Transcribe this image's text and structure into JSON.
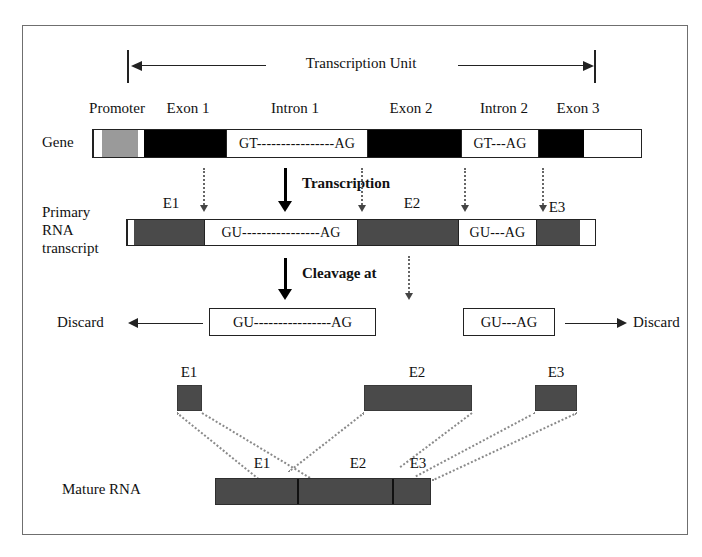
{
  "figure": {
    "span_label": "Transcription Unit",
    "process_labels": {
      "transcription": "Transcription",
      "cleavage": "Cleavage at"
    },
    "row_labels": {
      "gene": "Gene",
      "primary_rna": "Primary\nRNA\ntranscript",
      "primary_rna_line1": "Primary",
      "primary_rna_line2": "RNA",
      "primary_rna_line3": "transcript",
      "mature_rna": "Mature RNA"
    },
    "gene_row": {
      "top_labels": [
        {
          "text": "Promoter"
        },
        {
          "text": "Exon 1"
        },
        {
          "text": "Intron 1"
        },
        {
          "text": "Exon 2"
        },
        {
          "text": "Intron 2"
        },
        {
          "text": "Exon 3"
        }
      ],
      "segments": [
        {
          "kind": "promoter",
          "fill": "gray",
          "text": ""
        },
        {
          "kind": "exon",
          "fill": "black",
          "text": ""
        },
        {
          "kind": "intron",
          "fill": "white",
          "text": "GT----------------AG"
        },
        {
          "kind": "exon",
          "fill": "black",
          "text": ""
        },
        {
          "kind": "intron",
          "fill": "white",
          "text": "GT---AG"
        },
        {
          "kind": "exon",
          "fill": "black",
          "text": ""
        }
      ]
    },
    "rna_row": {
      "exon_labels": [
        "E1",
        "E2",
        "E3"
      ],
      "segments": [
        {
          "kind": "exon",
          "fill": "dkgray",
          "text": ""
        },
        {
          "kind": "intron",
          "fill": "white",
          "text": "GU----------------AG"
        },
        {
          "kind": "exon",
          "fill": "dkgray",
          "text": ""
        },
        {
          "kind": "intron",
          "fill": "white",
          "text": "GU---AG"
        },
        {
          "kind": "exon",
          "fill": "dkgray",
          "text": ""
        }
      ]
    },
    "cleavage_row": {
      "discard_left_label": "Discard",
      "discard_right_label": "Discard",
      "intron1_text": "GU----------------AG",
      "intron2_text": "GU---AG"
    },
    "free_exons": [
      {
        "label": "E1"
      },
      {
        "label": "E2"
      },
      {
        "label": "E3"
      }
    ],
    "mature_row": {
      "labels": [
        "E1",
        "E2",
        "E3"
      ]
    },
    "colors": {
      "exon_dna": "#000000",
      "promoter": "#9a9a9a",
      "exon_rna": "#4a4a4a",
      "frame": "#6f6f6f",
      "ink": "#111111",
      "dotted": "#8a8a8a"
    }
  }
}
